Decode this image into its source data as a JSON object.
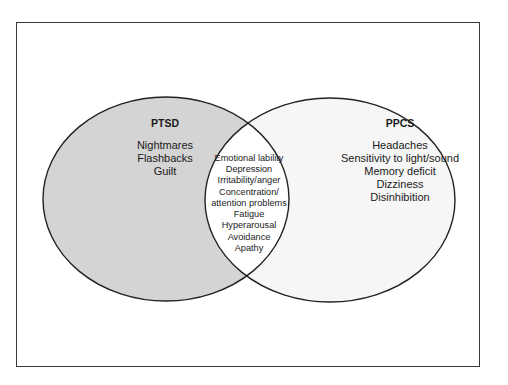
{
  "diagram": {
    "type": "venn",
    "sets": [
      {
        "id": "ptsd",
        "title": "PTSD",
        "fill": "#d4d4d4",
        "items": [
          "Nightmares",
          "Flashbacks",
          "Guilt"
        ]
      },
      {
        "id": "ppcs",
        "title": "PPCS",
        "fill": "#f6f6f6",
        "items": [
          "Headaches",
          "Sensitivity to light/sound",
          "Memory deficit",
          "Dizziness",
          "Disinhibition"
        ]
      }
    ],
    "overlap": {
      "fill": "#ffffff",
      "items": [
        "Emotional lability",
        "Depression",
        "Irritability/anger",
        "Concentration/",
        "attention problems",
        "Fatigue",
        "Hyperarousal",
        "Avoidance",
        "Apathy"
      ]
    },
    "colors": {
      "outline": "#222222",
      "frame_border": "#3a3a3a",
      "background": "#ffffff"
    }
  }
}
